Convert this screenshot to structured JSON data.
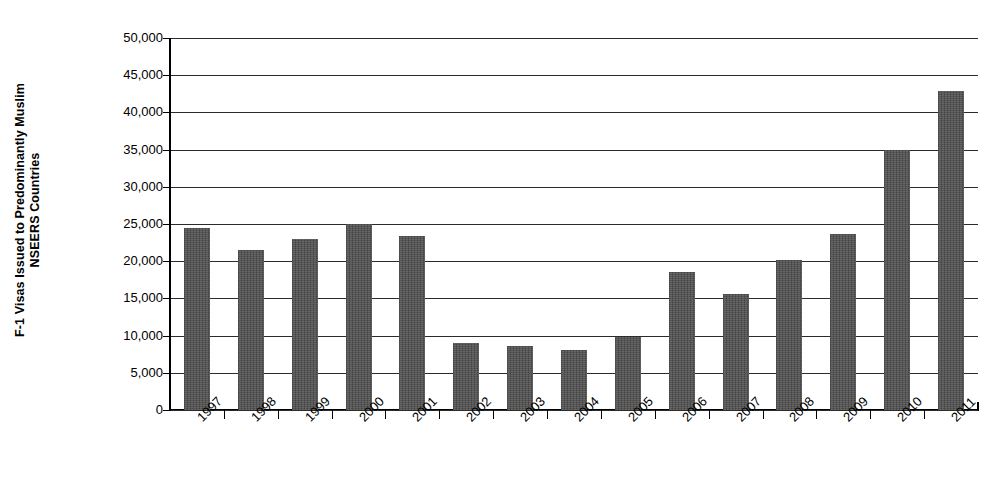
{
  "chart_data": {
    "type": "bar",
    "title": "",
    "xlabel": "",
    "ylabel": "F-1 Visas Issued to Predominantly Muslim NSEERS Countries",
    "ylabel_line1": "F-1 Visas Issued to Predominantly Muslim",
    "ylabel_line2": "NSEERS Countries",
    "categories": [
      "1997",
      "1998",
      "1999",
      "2000",
      "2001",
      "2002",
      "2003",
      "2004",
      "2005",
      "2006",
      "2007",
      "2008",
      "2009",
      "2010",
      "2011"
    ],
    "values": [
      24500,
      21500,
      23000,
      25000,
      23400,
      9000,
      8600,
      8100,
      9800,
      18600,
      15600,
      20100,
      23700,
      35000,
      42900
    ],
    "ylim": [
      0,
      50000
    ],
    "ytick_step": 5000,
    "ytick_labels": [
      "50,000",
      "45,000",
      "40,000",
      "35,000",
      "30,000",
      "25,000",
      "20,000",
      "15,000",
      "10,000",
      "5,000",
      "0"
    ],
    "ytick_values": [
      50000,
      45000,
      40000,
      35000,
      30000,
      25000,
      20000,
      15000,
      10000,
      5000,
      0
    ],
    "grid": true,
    "grid_axis": "y",
    "legend": false,
    "legend_position": "none",
    "xtick_rotation": -45,
    "bar_color": "#4d4d4d",
    "gridline_color": "#2b2b2b",
    "axis_color": "#000000",
    "background_color": "#ffffff",
    "series": [
      {
        "name": "F-1 Visas Issued",
        "values": [
          24500,
          21500,
          23000,
          25000,
          23400,
          9000,
          8600,
          8100,
          9800,
          18600,
          15600,
          20100,
          23700,
          35000,
          42900
        ]
      }
    ]
  }
}
